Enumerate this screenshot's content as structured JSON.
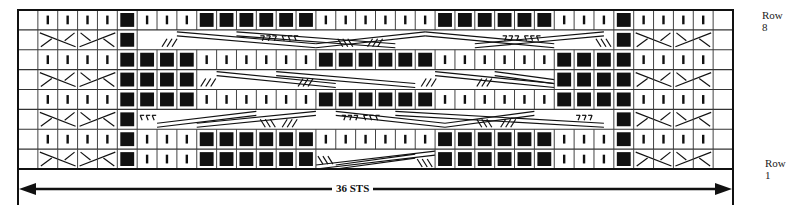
{
  "chart": {
    "title": "",
    "stitch_count_label": "36 STS",
    "row_labels": {
      "top": "Row 8",
      "bottom": "Row 1"
    },
    "columns": 36,
    "rows": 8,
    "legend_codes": {
      "e": "no stitch / edge",
      "k": "knit (vertical bar)",
      "p": "purl (filled square)",
      "c": "2-over-2 cable cross (edge cable)",
      "x": "wide cable crossing region"
    },
    "colors": {
      "ink": "#111111",
      "grid": "#555555",
      "background": "#ffffff"
    }
  },
  "chart_data": {
    "type": "table",
    "xlabel": "36 STS",
    "ylabel": "",
    "row_order": "top-to-bottom (Row 8 to Row 1)",
    "grid": [
      "ekkkkpkkkppppppkkkkkkppppppkkkpkkkke",
      "eccccpxxxxxxxxxxxxxxxxxxxxxxxxpcccce",
      "ekkkkppppkkkkkkppppppkkkkkkppppkkkke",
      "eccccppppxxxxxxxxxxxxxxxxxxppppcccce",
      "ekkkkppppkkkkkkppppppkkkkkkppppkkkke",
      "eccccpxxxxxxxxxxxxxxxxxxxxxxxxpcccce",
      "ekkkkpkkkppppppkkkkkkppppppkkkpkkkke",
      "eccccpkkkppppppxxxxxxppppppkkkpcccce"
    ]
  }
}
